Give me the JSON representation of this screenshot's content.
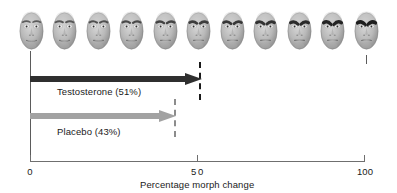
{
  "figure": {
    "background_color": "#ffffff",
    "axis_color": "#6f6f6f",
    "connector_color": "#5b5b5b"
  },
  "chart_data": {
    "type": "bar",
    "orientation": "horizontal",
    "title": "",
    "subtitle": "",
    "xlabel": "Percentage morph change",
    "ylabel": "",
    "xlim": [
      0,
      100
    ],
    "xticks": [
      0,
      50,
      100
    ],
    "xticklabels": [
      "0",
      "50",
      "100"
    ],
    "grid": false,
    "legend": "inline-labels",
    "categories": [
      "Testosterone",
      "Placebo"
    ],
    "series": [
      {
        "name": "Testosterone",
        "label": "Testosterone (51%)",
        "value": 51,
        "value_text": "51%",
        "color": "#2f2f2f",
        "marker": "dashed-line",
        "marker_color": "#1a1a1a"
      },
      {
        "name": "Placebo",
        "label": "Placebo (43%)",
        "value": 43,
        "value_text": "43%",
        "color": "#a2a2a2",
        "marker": "dashed-line",
        "marker_color": "#8c8c8c"
      }
    ],
    "annotations": [
      "Faces morph continuously from neutral (0% morph) to angry (100% morph)",
      "Dashed vertical lines mark each group's mean perceptual threshold"
    ]
  },
  "face_strip": {
    "name": "morph-face-sequence",
    "count": 11,
    "description": "Face morph continuum from neutral to angry expression",
    "faces": [
      {
        "index": 0,
        "morph_percent": 0,
        "expression": "neutral"
      },
      {
        "index": 1,
        "morph_percent": 10,
        "expression": "neutral"
      },
      {
        "index": 2,
        "morph_percent": 20,
        "expression": "neutral"
      },
      {
        "index": 3,
        "morph_percent": 30,
        "expression": "slightly-angry"
      },
      {
        "index": 4,
        "morph_percent": 40,
        "expression": "slightly-angry"
      },
      {
        "index": 5,
        "morph_percent": 50,
        "expression": "ambiguous"
      },
      {
        "index": 6,
        "morph_percent": 60,
        "expression": "ambiguous"
      },
      {
        "index": 7,
        "morph_percent": 70,
        "expression": "angry"
      },
      {
        "index": 8,
        "morph_percent": 80,
        "expression": "angry"
      },
      {
        "index": 9,
        "morph_percent": 90,
        "expression": "angry"
      },
      {
        "index": 10,
        "morph_percent": 100,
        "expression": "angry"
      }
    ]
  },
  "axis": {
    "label": "Percentage morph change",
    "tick_0": "0",
    "tick_50": "50",
    "tick_100": "100"
  }
}
